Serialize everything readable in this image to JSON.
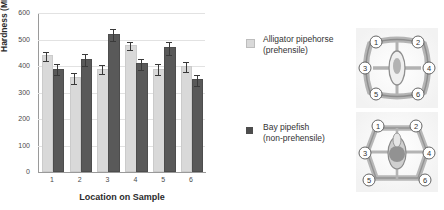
{
  "chart_data": {
    "type": "bar",
    "title": "",
    "xlabel": "Location on Sample",
    "ylabel": "Hardness (MPa)",
    "ylim": [
      0,
      600
    ],
    "yticks": [
      0,
      100,
      200,
      300,
      400,
      500,
      600
    ],
    "grid": true,
    "categories": [
      "1",
      "2",
      "3",
      "4",
      "5",
      "6"
    ],
    "legend_position": "right",
    "series": [
      {
        "name": "Alligator pipehorse (prehensile)",
        "color": "#d9d9d9",
        "values": [
          433,
          350,
          383,
          472,
          382,
          392
        ],
        "errors": [
          18,
          20,
          17,
          15,
          21,
          18
        ]
      },
      {
        "name": "Bay pipefish (non-prehensile)",
        "color": "#595959",
        "values": [
          383,
          418,
          513,
          402,
          463,
          343
        ],
        "errors": [
          20,
          22,
          22,
          21,
          24,
          21
        ]
      }
    ]
  },
  "legend": {
    "items": [
      {
        "line1": "Alligator pipehorse",
        "line2": "(prehensile)",
        "swatch": "light"
      },
      {
        "line1": "Bay pipefish",
        "line2": "(non-prehensile)",
        "swatch": "dark"
      }
    ]
  },
  "micrographs": [
    {
      "name": "alligator-pipehorse-cross-section",
      "labels": [
        "1",
        "2",
        "3",
        "4",
        "5",
        "6"
      ]
    },
    {
      "name": "bay-pipefish-cross-section",
      "labels": [
        "1",
        "2",
        "3",
        "4",
        "5",
        "6"
      ]
    }
  ]
}
